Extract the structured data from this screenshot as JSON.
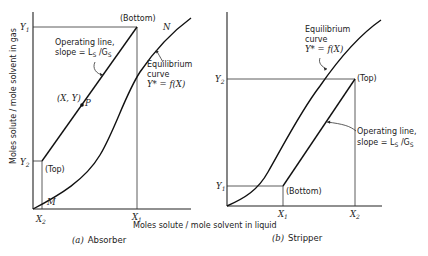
{
  "figure": {
    "x_axis_label": "Moles solute / mole solvent in liquid",
    "y_axis_label": "Moles solute / mole solvent in gas"
  },
  "panels": [
    {
      "id": "absorber",
      "caption_letter": "(a)",
      "caption": "Absorber",
      "labels": {
        "Y1": "Y",
        "Y1_sub": "1",
        "Y2": "Y",
        "Y2_sub": "2",
        "X1": "X",
        "X1_sub": "1",
        "X2": "X",
        "X2_sub": "2",
        "bottom": "(Bottom)",
        "top": "(Top)",
        "point_N": "N",
        "point_M": "M",
        "point_P": "P",
        "point_XY": "(X, Y)",
        "operating_line_1": "Operating line,",
        "operating_line_2": "slope = L",
        "operating_line_sub1": "S",
        "operating_line_mid": " /G",
        "operating_line_sub2": "S",
        "equilibrium_1": "Equilibrium",
        "equilibrium_2": "curve",
        "equilibrium_3": "Y* = f(X)"
      }
    },
    {
      "id": "stripper",
      "caption_letter": "(b)",
      "caption": "Stripper",
      "labels": {
        "Y1": "Y",
        "Y1_sub": "1",
        "Y2": "Y",
        "Y2_sub": "2",
        "X1": "X",
        "X1_sub": "1",
        "X2": "X",
        "X2_sub": "2",
        "bottom": "(Bottom)",
        "top": "(Top)",
        "operating_line_1": "Operating line,",
        "operating_line_2": "slope = L",
        "operating_line_sub1": "S",
        "operating_line_mid": " /G",
        "operating_line_sub2": "S",
        "equilibrium_1": "Equilibrium",
        "equilibrium_2": "curve",
        "equilibrium_3": "Y* = f(X)"
      }
    }
  ]
}
